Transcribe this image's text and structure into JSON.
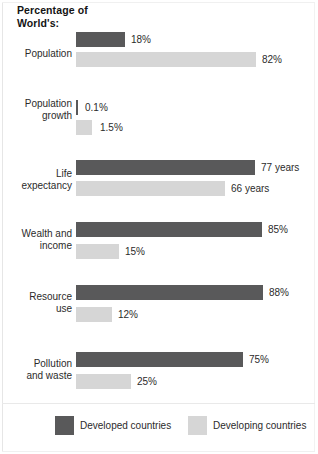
{
  "title": "Percentage of\nWorld's:",
  "colors": {
    "developed": "#59595a",
    "developing": "#d6d6d6",
    "background": "#ffffff",
    "text": "#2b2b2b"
  },
  "legend": {
    "developed_label": "Developed countries",
    "developing_label": "Developing countries"
  },
  "chart_data": {
    "type": "bar",
    "title": "Percentage of World's:",
    "orientation": "horizontal",
    "xlabel": "",
    "ylabel": "",
    "grid": false,
    "legend_position": "bottom",
    "categories": [
      "Population",
      "Population\ngrowth",
      "Life\nexpectancy",
      "Wealth and\nincome",
      "Resource\nuse",
      "Pollution\nand waste"
    ],
    "series": [
      {
        "name": "Developed countries",
        "color": "#59595a",
        "values": [
          18,
          0.1,
          77,
          85,
          88,
          75
        ],
        "labels": [
          "18%",
          "0.1%",
          "77 years",
          "85%",
          "88%",
          "75%"
        ]
      },
      {
        "name": "Developing countries",
        "color": "#d6d6d6",
        "values": [
          82,
          1.5,
          66,
          15,
          12,
          25
        ],
        "labels": [
          "82%",
          "1.5%",
          "66 years",
          "15%",
          "12%",
          "25%"
        ]
      }
    ]
  },
  "groups": [
    {
      "label": "Population",
      "label_top": 48,
      "top": 32,
      "bars": [
        {
          "series": "developed",
          "label": "18%",
          "top": 0,
          "width": 49,
          "value_x": 55
        },
        {
          "series": "developing",
          "label": "82%",
          "top": 20,
          "width": 180,
          "value_x": 186
        }
      ]
    },
    {
      "label": "Population\ngrowth",
      "label_top": 98,
      "top": 100,
      "bars": [
        {
          "series": "developed",
          "label": "0.1%",
          "top": 0,
          "width": 2,
          "value_x": 9
        },
        {
          "series": "developing",
          "label": "1.5%",
          "top": 20,
          "width": 16,
          "value_x": 24
        }
      ]
    },
    {
      "label": "Life\nexpectancy",
      "label_top": 168,
      "top": 160,
      "bars": [
        {
          "series": "developed",
          "label": "77 years",
          "top": 0,
          "width": 179,
          "value_x": 185
        },
        {
          "series": "developing",
          "label": "66 years",
          "top": 21,
          "width": 149,
          "value_x": 155
        }
      ]
    },
    {
      "label": "Wealth and\nincome",
      "label_top": 228,
      "top": 222,
      "bars": [
        {
          "series": "developed",
          "label": "85%",
          "top": 0,
          "width": 186,
          "value_x": 192
        },
        {
          "series": "developing",
          "label": "15%",
          "top": 22,
          "width": 43,
          "value_x": 49
        }
      ]
    },
    {
      "label": "Resource\nuse",
      "label_top": 291,
      "top": 285,
      "bars": [
        {
          "series": "developed",
          "label": "88%",
          "top": 0,
          "width": 187,
          "value_x": 193
        },
        {
          "series": "developing",
          "label": "12%",
          "top": 22,
          "width": 36,
          "value_x": 42
        }
      ]
    },
    {
      "label": "Pollution\nand waste",
      "label_top": 358,
      "top": 352,
      "bars": [
        {
          "series": "developed",
          "label": "75%",
          "top": 0,
          "width": 167,
          "value_x": 173
        },
        {
          "series": "developing",
          "label": "25%",
          "top": 22,
          "width": 55,
          "value_x": 61
        }
      ]
    }
  ]
}
